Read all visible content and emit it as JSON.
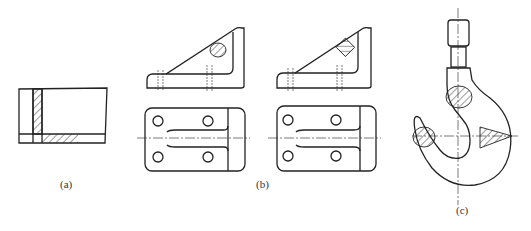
{
  "figure": {
    "panels": [
      {
        "id": "a",
        "label": "(a)",
        "description": "Tube/plate with hatched removed section"
      },
      {
        "id": "b",
        "label": "(b)",
        "description": "Bracket: two alternatives with rib sections, front and top views"
      },
      {
        "id": "c",
        "label": "(c)",
        "description": "Crane hook with removed sections"
      }
    ]
  },
  "colors": {
    "line": "#222222",
    "background": "#ffffff"
  }
}
